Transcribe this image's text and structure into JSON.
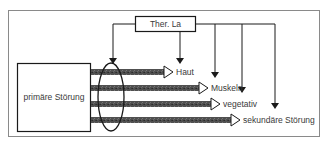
{
  "diagram": {
    "therapy_box": {
      "label": "Ther. La"
    },
    "primary_box": {
      "label": "primäre Störung"
    },
    "targets": [
      {
        "label": "Haut"
      },
      {
        "label": "Muskeln"
      },
      {
        "label": "vegetativ"
      },
      {
        "label": "sekundäre Störung"
      }
    ],
    "colors": {
      "frame": "#8a8a8a",
      "line": "#1a1a1a",
      "arrow_band": "#4a4a4a",
      "text": "#3a3a3a"
    }
  }
}
